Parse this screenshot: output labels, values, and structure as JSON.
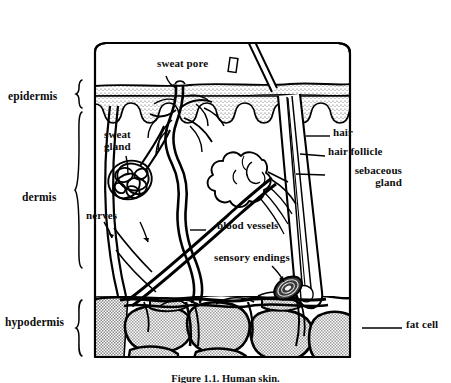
{
  "figure": {
    "caption": "Figure 1.1.  Human skin.",
    "colors": {
      "ink": "#000000",
      "fat_fill": "#b8b8b8",
      "epidermis_stipple": "#6e6e6e",
      "background": "#ffffff"
    }
  },
  "layer_labels": [
    {
      "id": "epidermis",
      "text": "epidermis",
      "x": 8,
      "y": 96
    },
    {
      "id": "dermis",
      "text": "dermis",
      "x": 22,
      "y": 197
    },
    {
      "id": "hypodermis",
      "text": "hypodermis",
      "x": 5,
      "y": 322
    }
  ],
  "part_labels": [
    {
      "id": "sweat-pore",
      "text": "sweat pore",
      "x": 157,
      "y": 64,
      "lines": 1
    },
    {
      "id": "sweat-gland",
      "text": "sweat\ngland",
      "x": 104,
      "y": 135,
      "lines": 2
    },
    {
      "id": "nerves",
      "text": "nerves",
      "x": 86,
      "y": 216,
      "lines": 1
    },
    {
      "id": "blood-vessels",
      "text": "blood vessels",
      "x": 217,
      "y": 226,
      "lines": 1
    },
    {
      "id": "sensory-endings",
      "text": "sensory endings",
      "x": 214,
      "y": 258,
      "lines": 1
    },
    {
      "id": "hair",
      "text": "hair",
      "x": 333,
      "y": 133,
      "lines": 1
    },
    {
      "id": "hair-follicle",
      "text": "hair follicle",
      "x": 328,
      "y": 152,
      "lines": 1
    },
    {
      "id": "sebaceous-gland",
      "text": "sebaceous\ngland",
      "x": 328,
      "y": 171,
      "lines": 2
    },
    {
      "id": "fat-cell",
      "text": "fat cell",
      "x": 406,
      "y": 325,
      "lines": 1
    }
  ],
  "structures": {
    "hair_shaft": "hair shaft emerging above skin surface",
    "epidermis_band": "stippled epidermal band with wavy dermo-epidermal junction",
    "sweat_duct": "coiled sweat duct rising to sweat pore",
    "sweat_gland_coil": "tangled coiled secretory gland in dermis",
    "sebaceous_gland": "lobed gland attached to hair follicle",
    "hair_follicle": "diagonal follicle sheath descending to bulb",
    "blood_vessel_network": "branching vessel network through dermis and hypodermis",
    "sensory_corpuscle": "layered ovoid sensory ending (corpuscle)",
    "fat_cells": "large stippled adipocytes filling hypodermis"
  }
}
